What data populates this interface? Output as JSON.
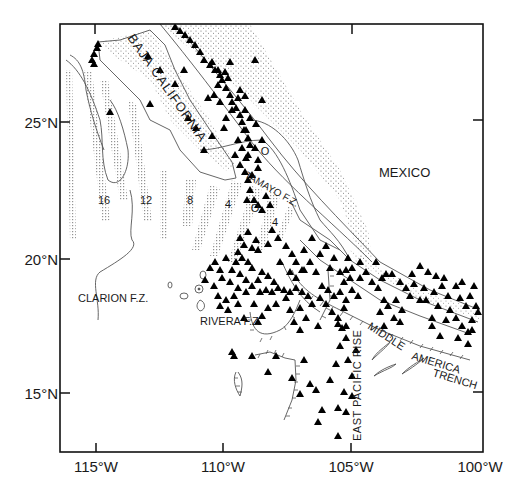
{
  "figure": {
    "type": "map",
    "frame": {
      "left": 60,
      "top": 24,
      "right": 483,
      "bottom": 452
    },
    "axes": {
      "x_ticks": [
        {
          "label": "115°W",
          "x": 96
        },
        {
          "label": "110°W",
          "x": 223
        },
        {
          "label": "105°W",
          "x": 351
        },
        {
          "label": "100°W",
          "x": 480
        }
      ],
      "y_ticks": [
        {
          "label": "25°N",
          "y": 122
        },
        {
          "label": "20°N",
          "y": 259
        },
        {
          "label": "15°N",
          "y": 393
        }
      ]
    },
    "labels": {
      "baja": "BAJA CALIFORNIA",
      "mexico": "MEXICO",
      "tamayo": "TAMAYO F.Z.",
      "clarion": "CLARION F.Z.",
      "rivera": "RIVERA F.Z.",
      "epr": "EAST PACIFIC RISE",
      "mat1": "MIDDLE",
      "mat2": "AMERICA",
      "mat3": "TRENCH"
    },
    "anomaly_ages": [
      {
        "label": "16",
        "x": 104,
        "y": 204
      },
      {
        "label": "12",
        "x": 146,
        "y": 204
      },
      {
        "label": "8",
        "x": 190,
        "y": 204
      },
      {
        "label": "4",
        "x": 228,
        "y": 208
      },
      {
        "label": "O",
        "x": 255,
        "y": 212
      },
      {
        "label": "4",
        "x": 275,
        "y": 226
      },
      {
        "label": "O",
        "x": 265,
        "y": 155
      }
    ],
    "legend_symbol": "triangle = earthquake epicenter",
    "epicenters": [
      [
        175,
        27
      ],
      [
        180,
        31
      ],
      [
        185,
        35
      ],
      [
        190,
        40
      ],
      [
        195,
        45
      ],
      [
        200,
        52
      ],
      [
        204,
        60
      ],
      [
        210,
        65
      ],
      [
        215,
        70
      ],
      [
        220,
        75
      ],
      [
        222,
        80
      ],
      [
        226,
        88
      ],
      [
        230,
        95
      ],
      [
        232,
        102
      ],
      [
        236,
        108
      ],
      [
        240,
        115
      ],
      [
        242,
        122
      ],
      [
        246,
        130
      ],
      [
        248,
        138
      ],
      [
        250,
        145
      ],
      [
        212,
        62
      ],
      [
        218,
        70
      ],
      [
        225,
        72
      ],
      [
        228,
        78
      ],
      [
        218,
        85
      ],
      [
        214,
        95
      ],
      [
        208,
        98
      ],
      [
        230,
        62
      ],
      [
        240,
        90
      ],
      [
        245,
        96
      ],
      [
        255,
        60
      ],
      [
        262,
        100
      ],
      [
        238,
        140
      ],
      [
        242,
        148
      ],
      [
        235,
        155
      ],
      [
        240,
        165
      ],
      [
        245,
        172
      ],
      [
        248,
        180
      ],
      [
        250,
        190
      ],
      [
        254,
        200
      ],
      [
        247,
        200
      ],
      [
        258,
        205
      ],
      [
        262,
        210
      ],
      [
        266,
        196
      ],
      [
        270,
        205
      ],
      [
        252,
        175
      ],
      [
        258,
        168
      ],
      [
        246,
        158
      ],
      [
        255,
        148
      ],
      [
        262,
        140
      ],
      [
        240,
        238
      ],
      [
        244,
        245
      ],
      [
        238,
        252
      ],
      [
        242,
        258
      ],
      [
        248,
        262
      ],
      [
        236,
        262
      ],
      [
        232,
        270
      ],
      [
        240,
        274
      ],
      [
        246,
        280
      ],
      [
        252,
        286
      ],
      [
        258,
        280
      ],
      [
        262,
        272
      ],
      [
        268,
        276
      ],
      [
        274,
        282
      ],
      [
        252,
        268
      ],
      [
        246,
        292
      ],
      [
        238,
        288
      ],
      [
        230,
        282
      ],
      [
        260,
        292
      ],
      [
        266,
        290
      ],
      [
        272,
        292
      ],
      [
        278,
        288
      ],
      [
        284,
        290
      ],
      [
        290,
        292
      ],
      [
        296,
        288
      ],
      [
        302,
        292
      ],
      [
        308,
        296
      ],
      [
        296,
        278
      ],
      [
        304,
        270
      ],
      [
        310,
        262
      ],
      [
        316,
        272
      ],
      [
        322,
        286
      ],
      [
        328,
        290
      ],
      [
        334,
        296
      ],
      [
        340,
        292
      ],
      [
        346,
        300
      ],
      [
        320,
        298
      ],
      [
        312,
        304
      ],
      [
        326,
        304
      ],
      [
        332,
        312
      ],
      [
        338,
        318
      ],
      [
        344,
        308
      ],
      [
        286,
        298
      ],
      [
        276,
        304
      ],
      [
        268,
        308
      ],
      [
        262,
        316
      ],
      [
        290,
        310
      ],
      [
        300,
        308
      ],
      [
        306,
        318
      ],
      [
        294,
        322
      ],
      [
        338,
        324
      ],
      [
        346,
        326
      ],
      [
        318,
        326
      ],
      [
        300,
        330
      ],
      [
        244,
        318
      ],
      [
        238,
        304
      ],
      [
        254,
        304
      ],
      [
        258,
        322
      ],
      [
        226,
        258
      ],
      [
        222,
        278
      ],
      [
        252,
        248
      ],
      [
        256,
        240
      ],
      [
        248,
        232
      ],
      [
        258,
        250
      ],
      [
        344,
        282
      ],
      [
        352,
        290
      ],
      [
        358,
        296
      ],
      [
        352,
        268
      ],
      [
        348,
        258
      ],
      [
        360,
        278
      ],
      [
        372,
        282
      ],
      [
        378,
        288
      ],
      [
        384,
        300
      ],
      [
        382,
        278
      ],
      [
        392,
        274
      ],
      [
        400,
        282
      ],
      [
        406,
        288
      ],
      [
        414,
        284
      ],
      [
        410,
        296
      ],
      [
        420,
        300
      ],
      [
        396,
        300
      ],
      [
        388,
        306
      ],
      [
        402,
        310
      ],
      [
        394,
        318
      ],
      [
        400,
        322
      ],
      [
        420,
        266
      ],
      [
        428,
        272
      ],
      [
        436,
        276
      ],
      [
        442,
        286
      ],
      [
        448,
        296
      ],
      [
        434,
        292
      ],
      [
        426,
        300
      ],
      [
        438,
        306
      ],
      [
        450,
        310
      ],
      [
        456,
        318
      ],
      [
        462,
        326
      ],
      [
        468,
        332
      ],
      [
        472,
        320
      ],
      [
        466,
        306
      ],
      [
        460,
        298
      ],
      [
        476,
        306
      ],
      [
        478,
        312
      ],
      [
        470,
        296
      ],
      [
        456,
        286
      ],
      [
        444,
        278
      ],
      [
        462,
        282
      ],
      [
        474,
        286
      ],
      [
        468,
        344
      ],
      [
        472,
        330
      ],
      [
        376,
        262
      ],
      [
        386,
        274
      ],
      [
        412,
        274
      ],
      [
        424,
        288
      ],
      [
        432,
        318
      ],
      [
        446,
        320
      ],
      [
        432,
        326
      ],
      [
        458,
        338
      ],
      [
        440,
        336
      ],
      [
        380,
        312
      ],
      [
        384,
        326
      ],
      [
        342,
        328
      ],
      [
        346,
        338
      ],
      [
        340,
        346
      ],
      [
        336,
        364
      ],
      [
        348,
        360
      ],
      [
        356,
        350
      ],
      [
        352,
        376
      ],
      [
        344,
        392
      ],
      [
        338,
        408
      ],
      [
        322,
        410
      ],
      [
        316,
        390
      ],
      [
        310,
        384
      ],
      [
        300,
        394
      ],
      [
        318,
        422
      ],
      [
        338,
        436
      ],
      [
        346,
        412
      ],
      [
        352,
        396
      ],
      [
        330,
        380
      ],
      [
        234,
        356
      ],
      [
        232,
        352
      ],
      [
        304,
        360
      ],
      [
        292,
        378
      ],
      [
        268,
        372
      ],
      [
        276,
        356
      ],
      [
        252,
        356
      ],
      [
        224,
        128
      ],
      [
        204,
        150
      ],
      [
        212,
        136
      ],
      [
        196,
        128
      ],
      [
        188,
        118
      ],
      [
        175,
        84
      ],
      [
        184,
        70
      ],
      [
        160,
        70
      ],
      [
        148,
        56
      ],
      [
        150,
        104
      ],
      [
        110,
        112
      ],
      [
        94,
        54
      ],
      [
        92,
        60
      ],
      [
        94,
        64
      ],
      [
        98,
        44
      ],
      [
        97,
        48
      ],
      [
        286,
        246
      ],
      [
        292,
        254
      ],
      [
        278,
        238
      ],
      [
        272,
        230
      ],
      [
        268,
        244
      ],
      [
        280,
        262
      ],
      [
        296,
        262
      ],
      [
        302,
        270
      ],
      [
        290,
        272
      ],
      [
        320,
        254
      ],
      [
        334,
        258
      ],
      [
        330,
        268
      ],
      [
        340,
        272
      ],
      [
        346,
        270
      ],
      [
        350,
        278
      ],
      [
        360,
        262
      ],
      [
        366,
        272
      ],
      [
        326,
        246
      ],
      [
        312,
        238
      ],
      [
        304,
        250
      ],
      [
        215,
        262
      ],
      [
        220,
        270
      ],
      [
        210,
        268
      ],
      [
        205,
        280
      ],
      [
        214,
        286
      ],
      [
        218,
        296
      ],
      [
        226,
        300
      ],
      [
        234,
        296
      ],
      [
        228,
        310
      ],
      [
        220,
        306
      ],
      [
        245,
        110
      ],
      [
        250,
        118
      ],
      [
        256,
        124
      ],
      [
        238,
        98
      ],
      [
        232,
        110
      ],
      [
        226,
        118
      ],
      [
        220,
        102
      ],
      [
        244,
        130
      ],
      [
        248,
        155
      ],
      [
        258,
        160
      ]
    ]
  }
}
